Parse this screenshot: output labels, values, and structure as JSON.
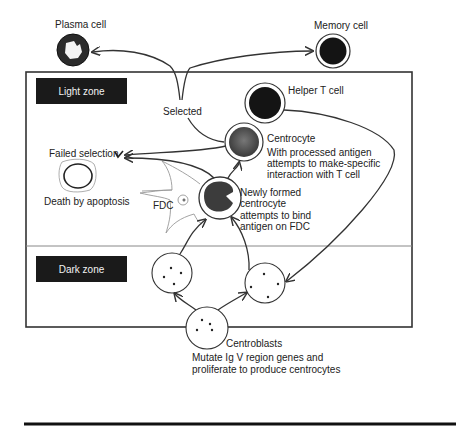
{
  "diagram": {
    "zones": {
      "light": "Light zone",
      "dark": "Dark zone"
    },
    "cells": {
      "plasma": "Plasma cell",
      "memory": "Memory cell",
      "helper_t": "Helper T cell",
      "centrocyte_title": "Centrocyte",
      "centrocyte_desc": [
        "With processed antigen",
        "attempts to make-specific",
        "interaction with T cell"
      ],
      "newly_formed": [
        "Newly formed",
        "centrocyte",
        "attempts to bind",
        "antigen on FDC"
      ],
      "fdc": "FDC",
      "apoptosis": "Death by apoptosis",
      "centroblasts_title": "Centroblasts",
      "centroblasts_desc": [
        "Mutate Ig V region genes and",
        "proliferate to produce centrocytes"
      ]
    },
    "labels": {
      "selected": "Selected",
      "failed_selection": "Failed selection"
    },
    "colors": {
      "zone_tag_bg": "#1a1a1a",
      "cell_dark": "#141414",
      "cell_grey": "#555555",
      "line": "#333333"
    }
  }
}
